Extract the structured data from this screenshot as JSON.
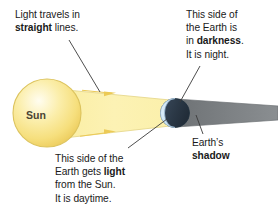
{
  "diagram": {
    "type": "science-illustration",
    "colors": {
      "background": "#ffffff",
      "sun_fill_light": "#fdf3c2",
      "sun_fill_mid": "#f7e07e",
      "sun_edge": "#e0c44a",
      "light_beam": "#fbf0a8",
      "light_beam_edge": "#e8d98a",
      "arrow_gold": "#e8c64a",
      "earth_lit": "#cfe4f3",
      "earth_dark": "#2c3a4a",
      "shadow_gray": "#7b7f82",
      "text": "#1a1a1a",
      "leader_line": "#3a3a3a"
    },
    "objects": [
      {
        "name": "sun",
        "label": "Sun"
      },
      {
        "name": "earth",
        "lit_side": "day",
        "dark_side": "night"
      },
      {
        "name": "light-beam",
        "direction": "left-to-right",
        "arrows": 2
      },
      {
        "name": "earth-shadow",
        "shape": "tapering cone to the right"
      }
    ]
  },
  "labels": {
    "sun": "Sun",
    "straight_lines": {
      "line1": "Light travels in",
      "line2_bold": "straight",
      "line2_rest": " lines."
    },
    "darkness": {
      "line1": "This side of",
      "line2": "the Earth is",
      "line3_pre": "in ",
      "line3_bold": "darkness",
      "line3_post": ".",
      "line4": "It is night."
    },
    "daytime": {
      "line1": "This side of the",
      "line2_pre": "Earth gets ",
      "line2_bold": "light",
      "line3": "from the Sun.",
      "line4": "It is daytime."
    },
    "earth_shadow": {
      "line1": "Earth’s",
      "line2_bold": "shadow"
    }
  }
}
